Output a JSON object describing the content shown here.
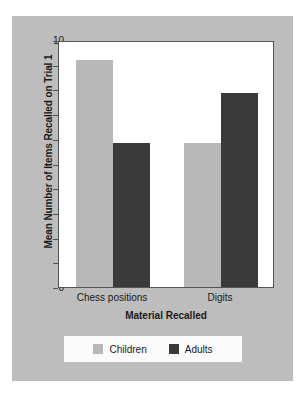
{
  "chart_data": {
    "type": "bar",
    "title": "",
    "xlabel": "Material Recalled",
    "ylabel": "Mean Number of Items Recalled on Trial 1",
    "categories": [
      "Chess positions",
      "Digits"
    ],
    "series": [
      {
        "name": "Children",
        "color": "#b8b8b8",
        "values": [
          9.2,
          5.85
        ]
      },
      {
        "name": "Adults",
        "color": "#3a3a3a",
        "values": [
          5.85,
          7.85
        ]
      }
    ],
    "ylim": [
      0,
      10
    ],
    "yticks": [
      0,
      1,
      2,
      3,
      4,
      5,
      6,
      7,
      8,
      9,
      10
    ],
    "ytick_labels": [
      "0",
      "1",
      "2",
      "3",
      "4",
      "5",
      "6",
      "7",
      "8",
      "9",
      "10"
    ],
    "grid": false,
    "legend_position": "bottom"
  },
  "colors": {
    "panel_background": "#bdbdbd",
    "plot_background": "#ffffff",
    "axis": "#555555",
    "text": "#1a1a1a",
    "children": "#b8b8b8",
    "adults": "#3a3a3a",
    "legend_background": "#fbfbfb"
  }
}
